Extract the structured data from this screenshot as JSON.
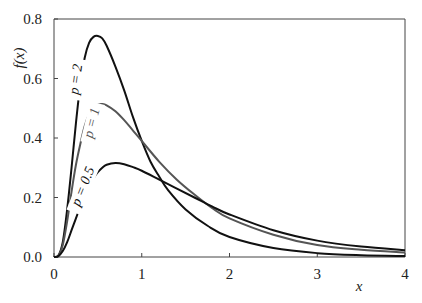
{
  "chart_data": {
    "type": "line",
    "title": "",
    "xlabel": "x",
    "ylabel": "f(x)",
    "xlim": [
      0,
      4
    ],
    "ylim": [
      0,
      0.8
    ],
    "xticks": [
      "0",
      "1",
      "2",
      "3",
      "4"
    ],
    "yticks": [
      "0.0",
      "0.2",
      "0.4",
      "0.6",
      "0.8"
    ],
    "grid": false,
    "legend": "inline labels along curves",
    "series": [
      {
        "name": "p = 2",
        "color": "#111111",
        "x": [
          0,
          0.05,
          0.1,
          0.15,
          0.2,
          0.25,
          0.3,
          0.35,
          0.4,
          0.45,
          0.5,
          0.55,
          0.6,
          0.7,
          0.8,
          0.9,
          1.0,
          1.1,
          1.2,
          1.3,
          1.5,
          1.75,
          2.0,
          2.5,
          3.0,
          3.5,
          4.0
        ],
        "y": [
          0,
          0.005,
          0.05,
          0.16,
          0.3,
          0.45,
          0.58,
          0.67,
          0.72,
          0.74,
          0.743,
          0.735,
          0.71,
          0.64,
          0.56,
          0.47,
          0.39,
          0.32,
          0.27,
          0.225,
          0.16,
          0.105,
          0.067,
          0.03,
          0.013,
          0.006,
          0.003
        ]
      },
      {
        "name": "p = 1",
        "color": "#555555",
        "x": [
          0,
          0.05,
          0.1,
          0.15,
          0.2,
          0.25,
          0.3,
          0.35,
          0.4,
          0.45,
          0.5,
          0.55,
          0.6,
          0.7,
          0.8,
          0.9,
          1.0,
          1.2,
          1.4,
          1.6,
          1.8,
          2.0,
          2.5,
          3.0,
          3.5,
          4.0
        ],
        "y": [
          0,
          0.004,
          0.04,
          0.12,
          0.22,
          0.31,
          0.38,
          0.44,
          0.48,
          0.5,
          0.512,
          0.514,
          0.51,
          0.49,
          0.46,
          0.425,
          0.39,
          0.32,
          0.26,
          0.21,
          0.165,
          0.13,
          0.075,
          0.04,
          0.024,
          0.015
        ]
      },
      {
        "name": "p = 0.5",
        "color": "#111111",
        "x": [
          0,
          0.05,
          0.1,
          0.15,
          0.2,
          0.25,
          0.3,
          0.35,
          0.4,
          0.45,
          0.5,
          0.55,
          0.6,
          0.7,
          0.8,
          0.9,
          1.0,
          1.2,
          1.4,
          1.6,
          1.8,
          2.0,
          2.5,
          3.0,
          3.5,
          4.0
        ],
        "y": [
          0,
          0.003,
          0.02,
          0.05,
          0.09,
          0.13,
          0.17,
          0.21,
          0.24,
          0.265,
          0.285,
          0.3,
          0.31,
          0.316,
          0.312,
          0.302,
          0.29,
          0.26,
          0.23,
          0.2,
          0.17,
          0.143,
          0.09,
          0.055,
          0.035,
          0.023
        ]
      }
    ],
    "annotations": [
      {
        "text": "p = 2",
        "x": 0.35,
        "y": 0.6,
        "rotation": -80
      },
      {
        "text": "p = 1",
        "x": 0.5,
        "y": 0.45,
        "rotation": -75
      },
      {
        "text": "p = 0.5",
        "x": 0.55,
        "y": 0.23,
        "rotation": -70
      }
    ]
  }
}
